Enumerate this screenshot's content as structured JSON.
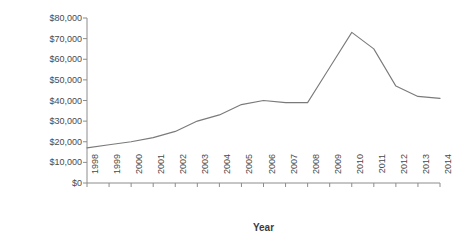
{
  "chart_data": {
    "type": "line",
    "title": "",
    "xlabel": "Year",
    "ylabel": "Spending (in millions of dollars)",
    "categories": [
      "1998",
      "1999",
      "2000",
      "2001",
      "2002",
      "2003",
      "2004",
      "2005",
      "2006",
      "2007",
      "2008",
      "2009",
      "2010",
      "2011",
      "2012",
      "2013",
      "2014"
    ],
    "values": [
      17000,
      18500,
      20000,
      22000,
      25000,
      30000,
      33000,
      38000,
      40000,
      39000,
      39000,
      56000,
      73000,
      65000,
      47000,
      42000,
      41000
    ],
    "series": [
      {
        "name": "Spending",
        "values": [
          17000,
          18500,
          20000,
          22000,
          25000,
          30000,
          33000,
          38000,
          40000,
          39000,
          39000,
          56000,
          73000,
          65000,
          47000,
          42000,
          41000
        ]
      }
    ],
    "ylim": [
      0,
      80000
    ],
    "ytick_values": [
      0,
      10000,
      20000,
      30000,
      40000,
      50000,
      60000,
      70000,
      80000
    ],
    "ytick_labels": [
      "$0",
      "$10,000",
      "$20,000",
      "$30,000",
      "$40,000",
      "$50,000",
      "$60,000",
      "$70,000",
      "$80,000"
    ],
    "xtick_labels": [
      "1998",
      "1999",
      "2000",
      "2001",
      "2002",
      "2003",
      "2004",
      "2005",
      "2006",
      "2007",
      "2008",
      "2009",
      "2010",
      "2011",
      "2012",
      "2013",
      "2014"
    ],
    "grid": false,
    "legend": null,
    "legend_position": "none",
    "line_color": "#7a7a7a",
    "axis_color": "#8c8c8c",
    "text_color": "#3b3b3b",
    "background_color": "#ffffff"
  }
}
